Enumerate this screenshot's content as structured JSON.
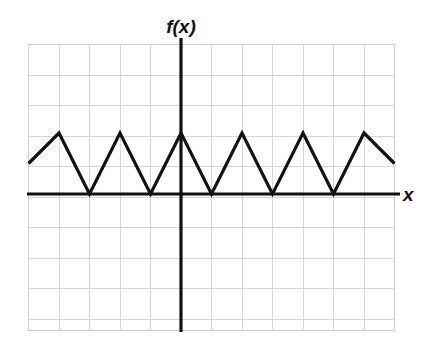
{
  "figure": {
    "background_color": "#ffffff",
    "title": "",
    "y_axis_label": "f(x)",
    "x_axis_label": "x",
    "axis_color": "#111111",
    "grid_color": "#d6d6d6",
    "curve_color": "#111111"
  },
  "chart_data": {
    "type": "line",
    "title": "",
    "subtitle": "",
    "xlabel": "x",
    "ylabel": "f(x)",
    "function_form": "triangle wave, period 2, amplitude 2, non-negative",
    "period": 2,
    "amplitude": 2,
    "minimum": 0,
    "maximum": 2,
    "grid": true,
    "gridlines_x_count": 12,
    "gridlines_y_count": 9,
    "grid_spacing_units": 1,
    "xlim": [
      -5,
      7
    ],
    "ylim": [
      -4.4,
      5
    ],
    "tick_labels_x": [],
    "tick_labels_y": [],
    "legend": [],
    "annotations": [],
    "x": [
      -5,
      -4,
      -3,
      -2,
      -1,
      0,
      1,
      2,
      3,
      4,
      5,
      6,
      7
    ],
    "y": [
      1,
      2,
      0,
      2,
      0,
      2,
      0,
      2,
      0,
      2,
      0,
      2,
      1
    ],
    "vertices": [
      {
        "x": -5,
        "y": 1,
        "kind": "edge-start"
      },
      {
        "x": -4,
        "y": 2,
        "kind": "peak"
      },
      {
        "x": -3,
        "y": 0,
        "kind": "valley"
      },
      {
        "x": -2,
        "y": 2,
        "kind": "peak"
      },
      {
        "x": -1,
        "y": 0,
        "kind": "valley"
      },
      {
        "x": 0,
        "y": 2,
        "kind": "peak"
      },
      {
        "x": 1,
        "y": 0,
        "kind": "valley"
      },
      {
        "x": 2,
        "y": 2,
        "kind": "peak"
      },
      {
        "x": 3,
        "y": 0,
        "kind": "valley"
      },
      {
        "x": 4,
        "y": 2,
        "kind": "peak"
      },
      {
        "x": 5,
        "y": 0,
        "kind": "valley"
      },
      {
        "x": 6,
        "y": 2,
        "kind": "peak"
      },
      {
        "x": 7,
        "y": 1,
        "kind": "edge-end"
      }
    ],
    "visible_peaks_pixels": [
      [
        59,
        133
      ],
      [
        181,
        133
      ],
      [
        302,
        133
      ]
    ],
    "visible_valleys_pixels": [
      [
        120,
        194
      ],
      [
        242,
        194
      ],
      [
        363,
        194
      ]
    ],
    "series": [
      {
        "name": "f(x)",
        "values": [
          1,
          2,
          0,
          2,
          0,
          2,
          0,
          2,
          0,
          2,
          0,
          2,
          1
        ]
      }
    ]
  },
  "geometry": {
    "plot_left": 28,
    "plot_right": 394,
    "plot_top": 44,
    "plot_bottom": 330,
    "cell": 30.5,
    "x_axis_y": 194,
    "y_axis_x": 181,
    "curve_path": "M 28,164 L 59,133 L 120,194 L 181,133 L 242,194 L 302,133 L 363,194 L 394,164",
    "label_fx_pos": [
      181,
      33
    ],
    "label_x_pos": [
      408,
      201
    ]
  }
}
